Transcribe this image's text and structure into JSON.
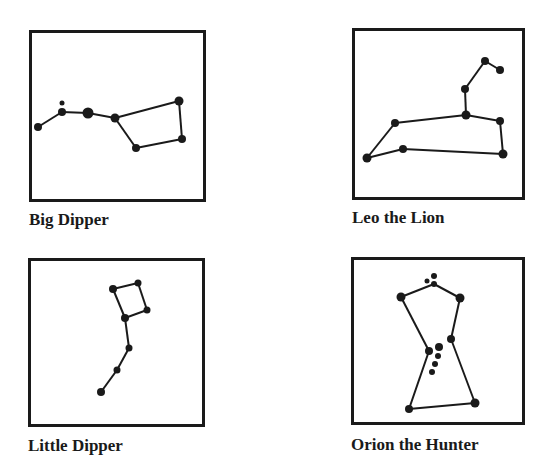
{
  "figure": {
    "colors": {
      "ink": "#1a1a1a",
      "background": "#ffffff"
    }
  },
  "constellations": [
    {
      "id": "big-dipper",
      "label": "Big Dipper",
      "box": {
        "x": 29,
        "y": 30,
        "w": 177,
        "h": 172
      },
      "label_pos": {
        "x": 29,
        "y": 211
      },
      "stars": [
        {
          "x": 38,
          "y": 127,
          "r": 4
        },
        {
          "x": 62,
          "y": 112,
          "r": 4
        },
        {
          "x": 62,
          "y": 103,
          "r": 2.5
        },
        {
          "x": 88,
          "y": 113,
          "r": 5.5
        },
        {
          "x": 115,
          "y": 118,
          "r": 4.5
        },
        {
          "x": 179,
          "y": 101,
          "r": 4.5
        },
        {
          "x": 182,
          "y": 139,
          "r": 4
        },
        {
          "x": 136,
          "y": 148,
          "r": 4
        }
      ],
      "lines": [
        [
          0,
          1
        ],
        [
          1,
          3
        ],
        [
          3,
          4
        ],
        [
          4,
          5
        ],
        [
          5,
          6
        ],
        [
          6,
          7
        ],
        [
          7,
          4
        ]
      ]
    },
    {
      "id": "leo-the-lion",
      "label": "Leo the Lion",
      "box": {
        "x": 352,
        "y": 28,
        "w": 173,
        "h": 172
      },
      "label_pos": {
        "x": 352,
        "y": 209
      },
      "stars": [
        {
          "x": 485,
          "y": 61,
          "r": 4
        },
        {
          "x": 500,
          "y": 70,
          "r": 4
        },
        {
          "x": 465,
          "y": 89,
          "r": 4
        },
        {
          "x": 466,
          "y": 115,
          "r": 4.5
        },
        {
          "x": 500,
          "y": 121,
          "r": 4
        },
        {
          "x": 503,
          "y": 154,
          "r": 4.5
        },
        {
          "x": 403,
          "y": 149,
          "r": 4
        },
        {
          "x": 367,
          "y": 158,
          "r": 4.5
        },
        {
          "x": 395,
          "y": 123,
          "r": 4
        }
      ],
      "lines": [
        [
          1,
          0
        ],
        [
          0,
          2
        ],
        [
          2,
          3
        ],
        [
          3,
          4
        ],
        [
          4,
          5
        ],
        [
          5,
          6
        ],
        [
          6,
          7
        ],
        [
          7,
          8
        ],
        [
          8,
          3
        ]
      ]
    },
    {
      "id": "little-dipper",
      "label": "Little Dipper",
      "box": {
        "x": 28,
        "y": 258,
        "w": 177,
        "h": 169
      },
      "label_pos": {
        "x": 28,
        "y": 437
      },
      "stars": [
        {
          "x": 113,
          "y": 289,
          "r": 4
        },
        {
          "x": 138,
          "y": 283,
          "r": 3.5
        },
        {
          "x": 147,
          "y": 310,
          "r": 3.5
        },
        {
          "x": 125,
          "y": 318,
          "r": 4
        },
        {
          "x": 129,
          "y": 348,
          "r": 3.5
        },
        {
          "x": 117,
          "y": 370,
          "r": 3.5
        },
        {
          "x": 101,
          "y": 392,
          "r": 4
        }
      ],
      "lines": [
        [
          0,
          1
        ],
        [
          1,
          2
        ],
        [
          2,
          3
        ],
        [
          3,
          0
        ],
        [
          3,
          4
        ],
        [
          4,
          5
        ],
        [
          5,
          6
        ]
      ]
    },
    {
      "id": "orion-the-hunter",
      "label": "Orion the Hunter",
      "box": {
        "x": 351,
        "y": 257,
        "w": 174,
        "h": 168
      },
      "label_pos": {
        "x": 351,
        "y": 436
      },
      "stars": [
        {
          "x": 434,
          "y": 276,
          "r": 3
        },
        {
          "x": 427,
          "y": 281,
          "r": 2.5
        },
        {
          "x": 434,
          "y": 284,
          "r": 3
        },
        {
          "x": 401,
          "y": 297,
          "r": 4.5
        },
        {
          "x": 460,
          "y": 298,
          "r": 4.5
        },
        {
          "x": 451,
          "y": 339,
          "r": 4
        },
        {
          "x": 429,
          "y": 351,
          "r": 4
        },
        {
          "x": 439,
          "y": 347,
          "r": 4
        },
        {
          "x": 438,
          "y": 356,
          "r": 3
        },
        {
          "x": 435,
          "y": 364,
          "r": 3
        },
        {
          "x": 432,
          "y": 372,
          "r": 3
        },
        {
          "x": 409,
          "y": 409,
          "r": 4
        },
        {
          "x": 475,
          "y": 403,
          "r": 4.5
        }
      ],
      "lines": [
        [
          3,
          2
        ],
        [
          2,
          4
        ],
        [
          3,
          6
        ],
        [
          4,
          5
        ],
        [
          6,
          11
        ],
        [
          5,
          12
        ],
        [
          11,
          12
        ]
      ]
    }
  ]
}
